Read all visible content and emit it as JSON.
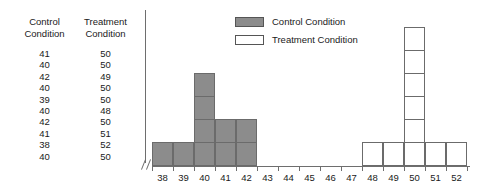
{
  "table": {
    "headers": [
      {
        "line1": "Control",
        "line2": "Condition"
      },
      {
        "line1": "Treatment",
        "line2": "Condition"
      }
    ],
    "rows": [
      {
        "control": "41",
        "treatment": "50"
      },
      {
        "control": "40",
        "treatment": "50"
      },
      {
        "control": "42",
        "treatment": "49"
      },
      {
        "control": "40",
        "treatment": "50"
      },
      {
        "control": "39",
        "treatment": "50"
      },
      {
        "control": "40",
        "treatment": "48"
      },
      {
        "control": "42",
        "treatment": "50"
      },
      {
        "control": "41",
        "treatment": "51"
      },
      {
        "control": "38",
        "treatment": "52"
      },
      {
        "control": "40",
        "treatment": "50"
      }
    ]
  },
  "legend": {
    "items": [
      {
        "label": "Control Condition",
        "color": "#8c8c8c"
      },
      {
        "label": "Treatment Condition",
        "color": "#ffffff"
      }
    ]
  },
  "chart_data": {
    "type": "bar",
    "title": "",
    "xlabel": "",
    "ylabel": "",
    "grid": false,
    "legend_position": "top-center",
    "axis_break": true,
    "categories": [
      "38",
      "39",
      "40",
      "41",
      "42",
      "43",
      "44",
      "45",
      "46",
      "47",
      "48",
      "49",
      "50",
      "51",
      "52"
    ],
    "xlim": [
      38,
      52
    ],
    "ylim": [
      0,
      6
    ],
    "series": [
      {
        "name": "Control Condition",
        "color": "#8c8c8c",
        "values": [
          1,
          1,
          4,
          2,
          2,
          0,
          0,
          0,
          0,
          0,
          0,
          0,
          0,
          0,
          0
        ]
      },
      {
        "name": "Treatment Condition",
        "color": "#ffffff",
        "values": [
          0,
          0,
          0,
          0,
          0,
          0,
          0,
          0,
          0,
          0,
          1,
          1,
          6,
          1,
          1
        ]
      }
    ]
  }
}
